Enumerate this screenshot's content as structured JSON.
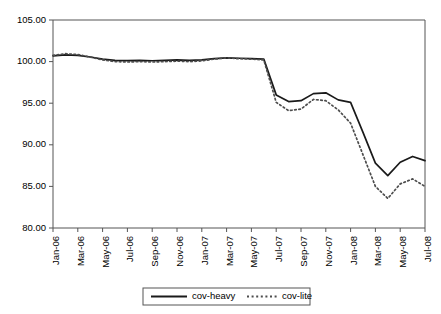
{
  "chart_data": {
    "type": "line",
    "title": "",
    "xlabel": "",
    "ylabel": "",
    "ylim": [
      80.0,
      105.0
    ],
    "ytick_step": 5.0,
    "ytick_labels": [
      "105.00",
      "100.00",
      "95.00",
      "90.00",
      "85.00",
      "80.00"
    ],
    "ytick_values": [
      105.0,
      100.0,
      95.0,
      90.0,
      85.0,
      80.0
    ],
    "grid": false,
    "legend_position": "bottom-center",
    "x": [
      "Jan-06",
      "Feb-06",
      "Mar-06",
      "Apr-06",
      "May-06",
      "Jun-06",
      "Jul-06",
      "Aug-06",
      "Sep-06",
      "Oct-06",
      "Nov-06",
      "Dec-06",
      "Jan-07",
      "Feb-07",
      "Mar-07",
      "Apr-07",
      "May-07",
      "Jun-07",
      "Jul-07",
      "Aug-07",
      "Sep-07",
      "Oct-07",
      "Nov-07",
      "Dec-07",
      "Jan-08",
      "Feb-08",
      "Mar-08",
      "Apr-08",
      "May-08",
      "Jun-08",
      "Jul-08"
    ],
    "xtick_labels": [
      "Jan-06",
      "Mar-06",
      "May-06",
      "Jul-06",
      "Sep-06",
      "Nov-06",
      "Jan-07",
      "Mar-07",
      "May-07",
      "Jul-07",
      "Sep-07",
      "Nov-07",
      "Jan-08",
      "Mar-08",
      "May-08",
      "Jul-08"
    ],
    "series": [
      {
        "name": "cov-heavy",
        "style": "solid",
        "color": "#1a1a1a",
        "values": [
          100.7,
          100.8,
          100.75,
          100.55,
          100.3,
          100.15,
          100.12,
          100.15,
          100.1,
          100.15,
          100.2,
          100.15,
          100.2,
          100.35,
          100.45,
          100.4,
          100.35,
          100.3,
          96.0,
          95.2,
          95.3,
          96.15,
          96.25,
          95.4,
          95.1,
          91.5,
          87.8,
          86.3,
          87.9,
          88.6,
          88.1
        ]
      },
      {
        "name": "cov-lite",
        "style": "dotted",
        "color": "#4d4d4d",
        "values": [
          100.75,
          100.95,
          100.85,
          100.55,
          100.2,
          100.0,
          99.95,
          100.0,
          99.95,
          100.0,
          100.05,
          100.0,
          100.08,
          100.3,
          100.45,
          100.35,
          100.3,
          100.2,
          95.1,
          94.1,
          94.3,
          95.45,
          95.3,
          94.2,
          92.6,
          88.8,
          85.0,
          83.55,
          85.3,
          85.9,
          85.0
        ]
      }
    ]
  },
  "legend": {
    "items": [
      {
        "label": "cov-heavy"
      },
      {
        "label": "cov-lite"
      }
    ]
  }
}
